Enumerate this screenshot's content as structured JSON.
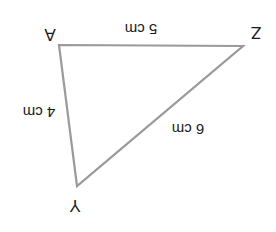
{
  "diagram": {
    "type": "triangle",
    "orientation": "rotated 180 degrees (text upside down)",
    "stroke_color": "#9a9a9a",
    "text_color": "#1a1a1a",
    "vertices": [
      {
        "label": "A",
        "x": 59,
        "y": 45
      },
      {
        "label": "Z",
        "x": 243,
        "y": 46
      },
      {
        "label": "Y",
        "x": 77,
        "y": 186
      }
    ],
    "edges": [
      {
        "from": "A",
        "to": "Z",
        "length_label": "5 cm"
      },
      {
        "from": "A",
        "to": "Y",
        "length_label": "4 cm"
      },
      {
        "from": "Z",
        "to": "Y",
        "length_label": "6 cm"
      }
    ]
  }
}
